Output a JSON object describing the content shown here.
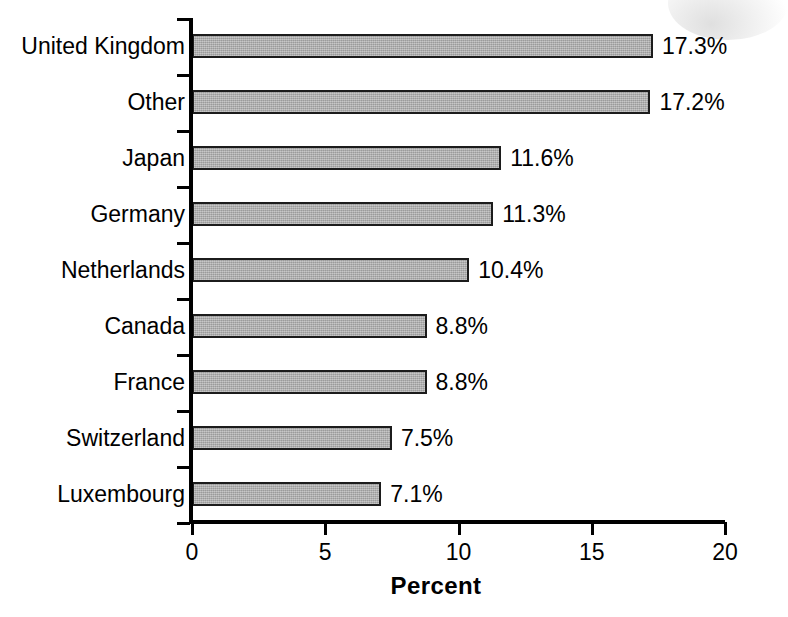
{
  "chart_data": {
    "type": "bar",
    "orientation": "horizontal",
    "title": "",
    "subtitle": "",
    "xlabel": "Percent",
    "ylabel": "",
    "xlim": [
      0,
      20
    ],
    "xticks": [
      "0",
      "5",
      "10",
      "15",
      "20"
    ],
    "xtick_values": [
      0,
      5,
      10,
      15,
      20
    ],
    "grid": false,
    "legend": false,
    "legend_position": "none",
    "categories": [
      "United Kingdom",
      "Other",
      "Japan",
      "Germany",
      "Netherlands",
      "Canada",
      "France",
      "Switzerland",
      "Luxembourg"
    ],
    "values": [
      17.3,
      17.2,
      11.6,
      11.3,
      10.4,
      8.8,
      8.8,
      7.5,
      7.1
    ],
    "value_labels": [
      "17.3%",
      "17.2%",
      "11.6%",
      "11.3%",
      "10.4%",
      "8.8%",
      "8.8%",
      "7.5%",
      "7.1%"
    ],
    "series": [
      {
        "name": "Percent",
        "values": [
          17.3,
          17.2,
          11.6,
          11.3,
          10.4,
          8.8,
          8.8,
          7.5,
          7.1
        ]
      }
    ]
  },
  "style": {
    "bar_fill": "#a9a9a9",
    "bar_border": "#1c1c1c",
    "axis_color": "#000000",
    "text_color": "#000000",
    "background": "#ffffff"
  }
}
